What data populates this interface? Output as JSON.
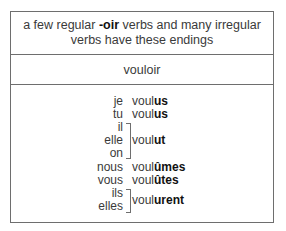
{
  "header": {
    "line1_pre": "a few regular ",
    "line1_bold": "-oir",
    "line1_post": " verbs and many irregular",
    "line2": "verbs have these endings"
  },
  "verb": "vouloir",
  "conjugations": [
    {
      "pronoun": "je",
      "stem": "voul",
      "ending": "us"
    },
    {
      "pronoun": "tu",
      "stem": "voul",
      "ending": "us"
    },
    {
      "pronouns": [
        "il",
        "elle",
        "on"
      ],
      "stem": "voul",
      "ending": "ut"
    },
    {
      "pronoun": "nous",
      "stem": "voul",
      "ending": "ûmes"
    },
    {
      "pronoun": "vous",
      "stem": "voul",
      "ending": "ûtes"
    },
    {
      "pronouns": [
        "ils",
        "elles"
      ],
      "stem": "voul",
      "ending": "urent"
    }
  ]
}
